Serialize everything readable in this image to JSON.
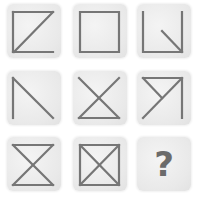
{
  "puzzle": {
    "grid": "3x3",
    "stroke_color": "#767676",
    "tile_color": "#ebebeb",
    "tiles": [
      {
        "index": 1,
        "row": 1,
        "col": 1,
        "shape": "square with left, top, bottom sides and diagonal top-right to bottom-left (Z with left edge)"
      },
      {
        "index": 2,
        "row": 1,
        "col": 2,
        "shape": "full square outline"
      },
      {
        "index": 3,
        "row": 1,
        "col": 3,
        "shape": "left, bottom, right sides with short diagonal into bottom-right corner"
      },
      {
        "index": 4,
        "row": 2,
        "col": 1,
        "shape": "left side with diagonal top-left to bottom-right"
      },
      {
        "index": 5,
        "row": 2,
        "col": 2,
        "shape": "two diagonals (X) with bottom side"
      },
      {
        "index": 6,
        "row": 2,
        "col": 3,
        "shape": "top and right sides, diagonal bottom-left to top-right, short diagonal from top-left to center"
      },
      {
        "index": 7,
        "row": 3,
        "col": 1,
        "shape": "hourglass: top, bottom sides and both diagonals"
      },
      {
        "index": 8,
        "row": 3,
        "col": 2,
        "shape": "full square with both diagonals"
      },
      {
        "index": 9,
        "row": 3,
        "col": 3,
        "shape": "unknown",
        "label": "?"
      }
    ]
  }
}
